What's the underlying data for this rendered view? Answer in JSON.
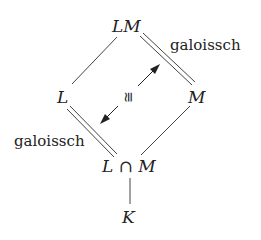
{
  "diagram": {
    "type": "field-extension lattice",
    "nodes": {
      "top": "LM",
      "left": "L",
      "right": "M",
      "bottom_left_part": "L",
      "bottom_cap": "∩",
      "bottom_right_part": "M",
      "base": "K"
    },
    "edge_labels": {
      "top_right": "galoissch",
      "bottom_left": "galoissch",
      "center": "≅"
    },
    "edges": [
      {
        "from": "LM",
        "to": "L",
        "style": "single"
      },
      {
        "from": "LM",
        "to": "M",
        "style": "double"
      },
      {
        "from": "L",
        "to": "L∩M",
        "style": "double"
      },
      {
        "from": "M",
        "to": "L∩M",
        "style": "single"
      },
      {
        "from": "L∩M",
        "to": "K",
        "style": "single"
      },
      {
        "from": "center",
        "to": "both",
        "style": "double-headed arrow"
      }
    ]
  }
}
